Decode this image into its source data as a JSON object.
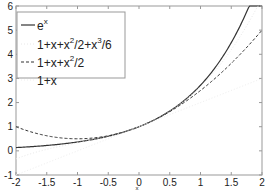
{
  "chart_data": {
    "type": "line",
    "title": "",
    "xlabel": "x",
    "ylabel": "",
    "xlim": [
      -2,
      2
    ],
    "ylim": [
      -1,
      6
    ],
    "xticks": [
      "-2",
      "-1.5",
      "-1",
      "-0.5",
      "0",
      "0.5",
      "1",
      "1.5",
      "2"
    ],
    "yticks": [
      "-1",
      "0",
      "1",
      "2",
      "3",
      "4",
      "5",
      "6"
    ],
    "grid": false,
    "legend_position": "upper left",
    "series": [
      {
        "name": "e^x",
        "style": "solid",
        "color": "#333333",
        "x": [
          -2,
          -1.5,
          -1,
          -0.5,
          0,
          0.5,
          1,
          1.5,
          1.79
        ],
        "values": [
          0.135,
          0.223,
          0.368,
          0.607,
          1.0,
          1.649,
          2.718,
          4.482,
          6.0
        ]
      },
      {
        "name": "1+x+x^2/2+x^3/6",
        "style": "dotted",
        "color": "#e8e8e8",
        "x": [
          -2,
          -1.5,
          -1,
          -0.5,
          0,
          0.5,
          1,
          1.5,
          2
        ],
        "values": [
          -0.333,
          0.063,
          0.333,
          0.604,
          1.0,
          1.646,
          2.667,
          4.188,
          6.333
        ]
      },
      {
        "name": "1+x+x^2/2",
        "style": "dashed",
        "color": "#333333",
        "x": [
          -2,
          -1.5,
          -1,
          -0.5,
          0,
          0.5,
          1,
          1.5,
          2
        ],
        "values": [
          1.0,
          0.625,
          0.5,
          0.625,
          1.0,
          1.625,
          2.5,
          3.625,
          5.0
        ]
      },
      {
        "name": "1+x",
        "style": "dotted",
        "color": "#eeeeee",
        "x": [
          -2,
          2
        ],
        "values": [
          -1.0,
          3.0
        ]
      }
    ]
  },
  "legend": {
    "items": [
      {
        "label": "e",
        "sup": "x"
      },
      {
        "label": "1+x+x",
        "sup1": "2",
        "mid": "/2+x",
        "sup2": "3",
        "end": "/6"
      },
      {
        "label": "1+x+x",
        "sup1": "2",
        "end": "/2"
      },
      {
        "label": "1+x"
      }
    ]
  },
  "axes": {
    "xlabel": "x",
    "xticks": [
      "-2",
      "-1.5",
      "-1",
      "-0.5",
      "0",
      "0.5",
      "1",
      "1.5",
      "2"
    ],
    "yticks": [
      "-1",
      "0",
      "1",
      "2",
      "3",
      "4",
      "5",
      "6"
    ]
  }
}
